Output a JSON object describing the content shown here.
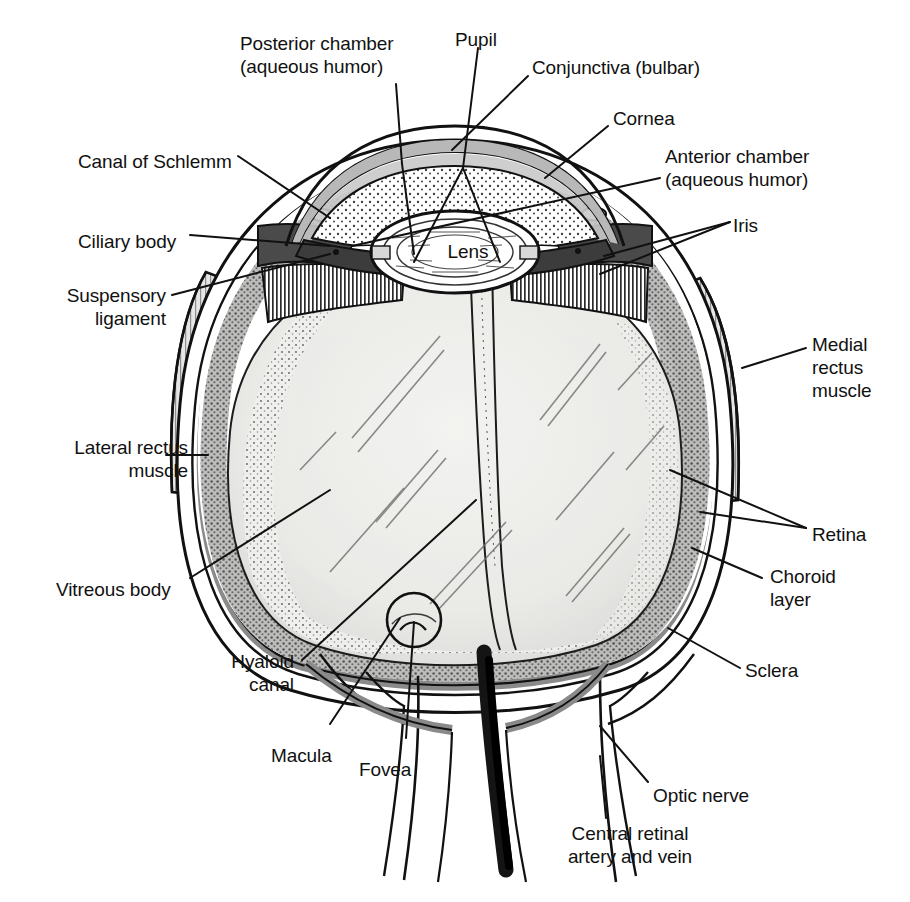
{
  "diagram": {
    "type": "anatomical-cross-section",
    "colors": {
      "background": "#ffffff",
      "ink": "#111111",
      "sclera_fill": "#ffffff",
      "choroid_gray": "#8f8f8f",
      "cornea_gray": "#b8b8b8",
      "iris_dark": "#4a4a4a",
      "vitreous_fill": "#ededeb",
      "retina_stipple": "#a9a9a9",
      "nerve_black": "#1a1a1a"
    },
    "inner_labels": [
      {
        "id": "lens",
        "text": "Lens",
        "x": 468,
        "y": 248
      }
    ],
    "labels": [
      {
        "id": "posterior-chamber",
        "text": "Posterior chamber\n(aqueous humor)",
        "x": 240,
        "y": 32,
        "align": "left"
      },
      {
        "id": "pupil",
        "text": "Pupil",
        "x": 455,
        "y": 28,
        "align": "left"
      },
      {
        "id": "conjunctiva",
        "text": "Conjunctiva (bulbar)",
        "x": 532,
        "y": 56,
        "align": "left"
      },
      {
        "id": "cornea",
        "text": "Cornea",
        "x": 613,
        "y": 107,
        "align": "left"
      },
      {
        "id": "anterior-chamber",
        "text": "Anterior chamber\n(aqueous humor)",
        "x": 665,
        "y": 145,
        "align": "left"
      },
      {
        "id": "iris",
        "text": "Iris",
        "x": 733,
        "y": 214,
        "align": "left"
      },
      {
        "id": "canal-of-schlemm",
        "text": "Canal of Schlemm",
        "x": 78,
        "y": 150,
        "align": "left"
      },
      {
        "id": "ciliary-body",
        "text": "Ciliary body",
        "x": 78,
        "y": 230,
        "align": "left"
      },
      {
        "id": "suspensory-ligament",
        "text": "Suspensory\nligament",
        "x": 46,
        "y": 299,
        "align": "right",
        "w": 120
      },
      {
        "id": "lateral-rectus",
        "text": "Lateral rectus\nmuscle",
        "x": 36,
        "y": 438,
        "align": "right",
        "w": 152
      },
      {
        "id": "vitreous-body",
        "text": "Vitreous body",
        "x": 56,
        "y": 578,
        "align": "left"
      },
      {
        "id": "hyaloid-canal",
        "text": "Hyaloid\ncanal",
        "x": 188,
        "y": 662,
        "align": "right",
        "w": 106
      },
      {
        "id": "macula",
        "text": "Macula",
        "x": 271,
        "y": 744,
        "align": "left"
      },
      {
        "id": "fovea",
        "text": "Fovea",
        "x": 359,
        "y": 758,
        "align": "left"
      },
      {
        "id": "medial-rectus",
        "text": "Medial\nrectus\nmuscle",
        "x": 812,
        "y": 333,
        "align": "left"
      },
      {
        "id": "retina",
        "text": "Retina",
        "x": 812,
        "y": 523,
        "align": "left"
      },
      {
        "id": "choroid-layer",
        "text": "Choroid\nlayer",
        "x": 770,
        "y": 565,
        "align": "left"
      },
      {
        "id": "sclera",
        "text": "Sclera",
        "x": 745,
        "y": 659,
        "align": "left"
      },
      {
        "id": "optic-nerve",
        "text": "Optic nerve",
        "x": 653,
        "y": 784,
        "align": "left"
      },
      {
        "id": "central-retinal",
        "text": "Central retinal\nartery and vein",
        "x": 540,
        "y": 825,
        "align": "left"
      }
    ],
    "structures": [
      "cornea",
      "conjunctiva",
      "anterior chamber",
      "posterior chamber",
      "iris",
      "pupil",
      "lens",
      "ciliary body",
      "suspensory ligament",
      "canal of Schlemm",
      "vitreous body",
      "hyaloid canal",
      "retina",
      "choroid layer",
      "sclera",
      "macula",
      "fovea",
      "optic nerve",
      "central retinal artery and vein",
      "lateral rectus muscle",
      "medial rectus muscle"
    ]
  }
}
